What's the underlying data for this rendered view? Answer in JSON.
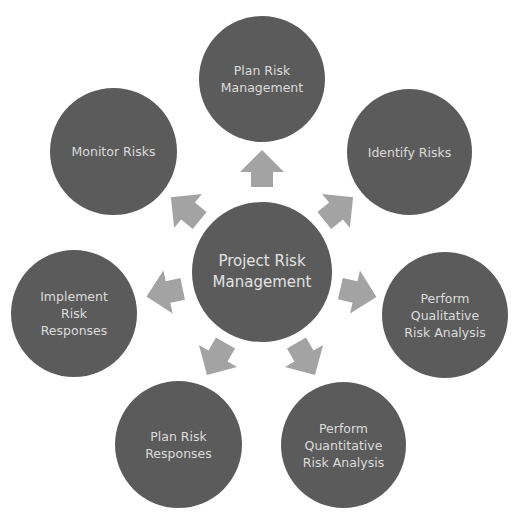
{
  "diagram": {
    "center": {
      "label": "Project Risk\nManagement"
    },
    "nodes": [
      {
        "id": "plan-risk-management",
        "label": "Plan Risk\nManagement"
      },
      {
        "id": "identify-risks",
        "label": "Identify Risks"
      },
      {
        "id": "perform-qualitative",
        "label": "Perform\nQualitative\nRisk Analysis"
      },
      {
        "id": "perform-quantitative",
        "label": "Perform\nQuantitative\nRisk Analysis"
      },
      {
        "id": "plan-risk-responses",
        "label": "Plan Risk\nResponses"
      },
      {
        "id": "implement-risk-responses",
        "label": "Implement\nRisk\nResponses"
      },
      {
        "id": "monitor-risks",
        "label": "Monitor Risks"
      }
    ],
    "colors": {
      "node": "#5b5b5b",
      "arrow": "#a3a3a3",
      "text": "#dcdcdc"
    }
  }
}
